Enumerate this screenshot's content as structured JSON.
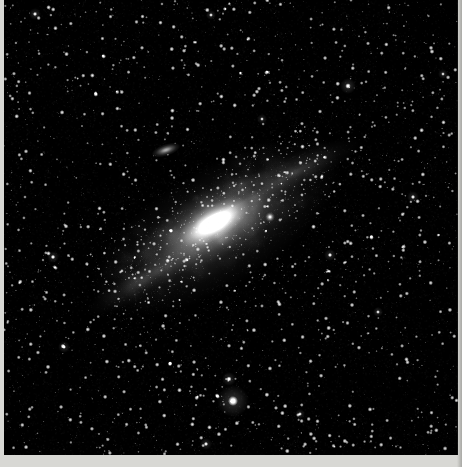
{
  "image": {
    "kind": "astrophotograph",
    "subject": "Andromeda Galaxy (M31)",
    "alt_text": "Black and white long-exposure photograph of the Andromeda Galaxy tilted diagonally across a dense star field",
    "width": 462,
    "height": 467,
    "background_color": "#000000",
    "border_color": "#d8d8d4",
    "plate": {
      "x": 4,
      "y": 0,
      "width": 454,
      "height": 455
    }
  },
  "sky": {
    "background_color": "#000000",
    "star_color": "#ffffff",
    "star_count": 3400,
    "seed": 20231107,
    "milky_way_glow": false,
    "vignette": true
  },
  "objects": [
    {
      "name": "m31-core",
      "label": "M31 nucleus",
      "type": "galaxy-core",
      "cx": 214,
      "cy": 222,
      "rx": 40,
      "ry": 17,
      "angle_deg": -31,
      "peak_brightness": 0.96,
      "color": "#ffffff"
    },
    {
      "name": "m31-inner-disk",
      "label": "M31 inner disk",
      "type": "galaxy-disk",
      "cx": 214,
      "cy": 224,
      "rx": 86,
      "ry": 34,
      "angle_deg": -31,
      "peak_brightness": 0.52,
      "color": "#e8e8e8"
    },
    {
      "name": "m31-outer-halo",
      "label": "M31 outer halo",
      "type": "galaxy-halo",
      "cx": 216,
      "cy": 228,
      "rx": 142,
      "ry": 60,
      "angle_deg": -31,
      "peak_brightness": 0.26,
      "color": "#cfcfcf"
    },
    {
      "name": "m31-ne-arm",
      "label": "Northeast spiral arm",
      "type": "spiral-arm",
      "cx": 292,
      "cy": 172,
      "rx": 74,
      "ry": 17,
      "angle_deg": -24,
      "peak_brightness": 0.2,
      "color": "#bdbdbd"
    },
    {
      "name": "m31-sw-arm",
      "label": "Southwest spiral arm",
      "type": "spiral-arm",
      "cx": 146,
      "cy": 278,
      "rx": 70,
      "ry": 16,
      "angle_deg": -31,
      "peak_brightness": 0.16,
      "color": "#b0b0b0"
    },
    {
      "name": "m31-dust-lane-outer",
      "label": "Outer dust lane",
      "type": "dust-lane",
      "cx": 274,
      "cy": 176,
      "rx": 76,
      "ry": 6,
      "angle_deg": -26,
      "peak_brightness": 0.3,
      "color": "#000000"
    },
    {
      "name": "m31-dust-lane-inner",
      "label": "Inner dust lane",
      "type": "dust-lane",
      "cx": 252,
      "cy": 192,
      "rx": 58,
      "ry": 5,
      "angle_deg": -28,
      "peak_brightness": 0.24,
      "color": "#000000"
    },
    {
      "name": "m110",
      "label": "M110 (NGC 205)",
      "type": "satellite-galaxy",
      "cx": 166,
      "cy": 150,
      "rx": 15,
      "ry": 6,
      "angle_deg": -18,
      "peak_brightness": 0.72,
      "color": "#ffffff"
    },
    {
      "name": "m32",
      "label": "M32 (NGC 221)",
      "type": "satellite-galaxy",
      "cx": 270,
      "cy": 217,
      "rx": 5,
      "ry": 5,
      "angle_deg": 0,
      "peak_brightness": 0.98,
      "color": "#ffffff"
    }
  ],
  "bright_stars": [
    {
      "name": "bright-star-south",
      "cx": 233,
      "cy": 401,
      "radius": 5.0,
      "halo": 16,
      "brightness": 1.0
    },
    {
      "name": "bright-star-south-upper",
      "cx": 229,
      "cy": 379,
      "radius": 2.6,
      "halo": 7,
      "brightness": 0.92
    },
    {
      "name": "bright-star-upper-right",
      "cx": 348,
      "cy": 86,
      "radius": 2.8,
      "halo": 8,
      "brightness": 0.95
    },
    {
      "name": "bright-star-right",
      "cx": 330,
      "cy": 255,
      "radius": 2.2,
      "halo": 6,
      "brightness": 0.88
    },
    {
      "name": "bright-star-far-right",
      "cx": 413,
      "cy": 197,
      "radius": 2.2,
      "halo": 6,
      "brightness": 0.87
    },
    {
      "name": "bright-star-left",
      "cx": 53,
      "cy": 257,
      "radius": 2.3,
      "halo": 6,
      "brightness": 0.9
    },
    {
      "name": "bright-star-lower-left",
      "cx": 64,
      "cy": 347,
      "radius": 2.1,
      "halo": 6,
      "brightness": 0.86
    },
    {
      "name": "bright-star-top-left",
      "cx": 35,
      "cy": 14,
      "radius": 2.2,
      "halo": 6,
      "brightness": 0.88
    },
    {
      "name": "bright-star-top-mid",
      "cx": 211,
      "cy": 15,
      "radius": 2.0,
      "halo": 5,
      "brightness": 0.85
    },
    {
      "name": "bright-star-bottom-mid",
      "cx": 206,
      "cy": 444,
      "radius": 2.2,
      "halo": 6,
      "brightness": 0.88
    },
    {
      "name": "bright-star-mid-right",
      "cx": 378,
      "cy": 312,
      "radius": 2.0,
      "halo": 5,
      "brightness": 0.84
    },
    {
      "name": "bright-star-low-right",
      "cx": 300,
      "cy": 414,
      "radius": 2.0,
      "halo": 5,
      "brightness": 0.83
    },
    {
      "name": "bright-star-upper-mid",
      "cx": 262,
      "cy": 119,
      "radius": 1.9,
      "halo": 5,
      "brightness": 0.82
    },
    {
      "name": "bright-star-edge-right",
      "cx": 443,
      "cy": 74,
      "radius": 1.9,
      "halo": 5,
      "brightness": 0.82
    }
  ]
}
